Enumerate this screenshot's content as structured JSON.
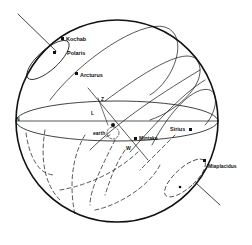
{
  "diagram": {
    "type": "celestial-sphere",
    "colors": {
      "ink": "#111111",
      "background": "#ffffff"
    },
    "directions": {
      "north": "N",
      "south": "S",
      "west": "W",
      "zenith": "Z"
    },
    "labels": {
      "latitude": "L",
      "earth": "earth"
    },
    "stars": [
      {
        "name": "Kochab"
      },
      {
        "name": "Polaris"
      },
      {
        "name": "Arcturus"
      },
      {
        "name": "Mintaka"
      },
      {
        "name": "Sirius"
      },
      {
        "name": "Miaplacidus"
      }
    ]
  }
}
